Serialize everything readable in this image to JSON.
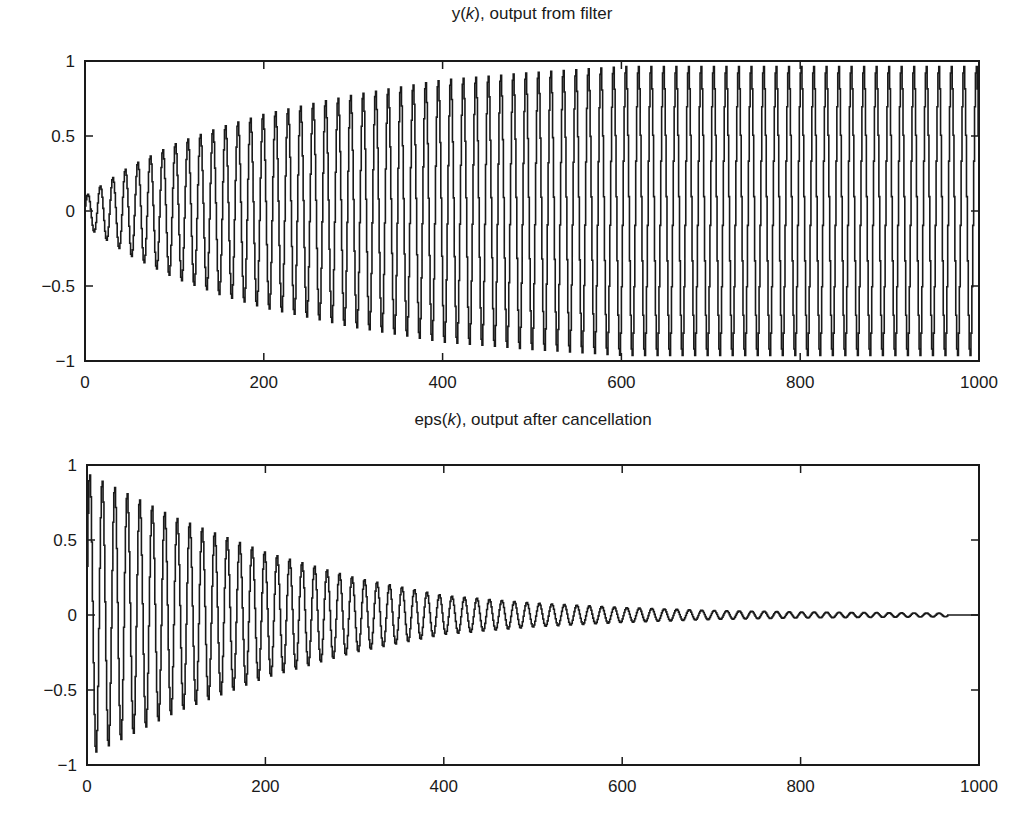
{
  "chart_data": [
    {
      "type": "line",
      "title": "y(k), output from filter",
      "title_parts": {
        "prefix": "y(",
        "var": "k",
        "suffix": "), output from filter"
      },
      "xlabel": "",
      "ylabel": "",
      "xlim": [
        0,
        1000
      ],
      "ylim": [
        -1,
        1
      ],
      "xticks": [
        0,
        200,
        400,
        600,
        800,
        1000
      ],
      "xtick_labels": [
        "0",
        "200",
        "400",
        "600",
        "800",
        "1000"
      ],
      "yticks": [
        1,
        0.5,
        0,
        -0.5,
        -1
      ],
      "ytick_labels": [
        "1",
        "0.5",
        "0",
        "−0.5",
        "−1"
      ],
      "grid": false,
      "legend": null,
      "style": "stairs",
      "signal": {
        "description": "Sampled sinusoid (zero-order hold) with growing envelope",
        "period_samples": 14,
        "n_samples": 1000,
        "envelope": {
          "k": [
            0,
            25,
            50,
            100,
            150,
            200,
            300,
            400,
            500,
            600,
            1000
          ],
          "amplitude": [
            0.1,
            0.2,
            0.3,
            0.45,
            0.56,
            0.65,
            0.78,
            0.88,
            0.93,
            0.97,
            0.97
          ]
        },
        "end_k": 1000
      },
      "plot_box": {
        "left": 85,
        "top": 61,
        "right": 979,
        "bottom": 361
      }
    },
    {
      "type": "line",
      "title": "eps(k), output after cancellation",
      "title_parts": {
        "prefix": "eps(",
        "var": "k",
        "suffix": "), output after cancellation"
      },
      "xlabel": "",
      "ylabel": "",
      "xlim": [
        0,
        1000
      ],
      "ylim": [
        -1,
        1
      ],
      "xticks": [
        0,
        200,
        400,
        600,
        800,
        1000
      ],
      "xtick_labels": [
        "0",
        "200",
        "400",
        "600",
        "800",
        "1000"
      ],
      "yticks": [
        1,
        0.5,
        0,
        -0.5,
        -1
      ],
      "ytick_labels": [
        "1",
        "0.5",
        "0",
        "−0.5",
        "−1"
      ],
      "grid": false,
      "legend": null,
      "style": "stairs",
      "signal": {
        "description": "Sampled sinusoid (zero-order hold) with decaying envelope, converges to 0",
        "period_samples": 14,
        "n_samples": 1000,
        "envelope": {
          "k": [
            0,
            50,
            100,
            200,
            300,
            400,
            500,
            600,
            700,
            800,
            900,
            965,
            1000
          ],
          "amplitude": [
            0.95,
            0.8,
            0.65,
            0.42,
            0.25,
            0.13,
            0.08,
            0.05,
            0.03,
            0.02,
            0.015,
            0.012,
            0
          ]
        },
        "end_k": 965
      },
      "plot_box": {
        "left": 87,
        "top": 465,
        "right": 979,
        "bottom": 765
      }
    }
  ],
  "colors": {
    "line": "#1a1a1a",
    "axes": "#1a1a1a",
    "background": "#ffffff"
  }
}
